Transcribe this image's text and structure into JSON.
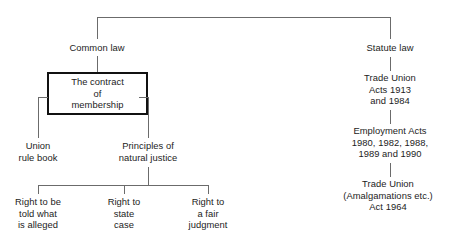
{
  "diagram": {
    "type": "tree-chart",
    "title_visible": false,
    "orientation": "top-down",
    "colors": {
      "background": "#ffffff",
      "text": "#1c1c1c",
      "connector": "#6b6b6b",
      "box_border": "#111111"
    },
    "nodes": {
      "common_law": "Common law",
      "statute_law": "Statute law",
      "contract_of_membership": "The contract\nof\nmembership",
      "union_rule_book": "Union\nrule book",
      "principles_of_natural_justice": "Principles of\nnatural justice",
      "right_told_what_alleged": "Right to be\ntold what\nis alleged",
      "right_state_case": "Right to\nstate\ncase",
      "right_fair_judgment": "Right to\na fair\njudgment",
      "trade_union_acts": "Trade Union\nActs 1913\nand 1984",
      "employment_acts": "Employment Acts\n1980, 1982, 1988,\n1989 and 1990",
      "trade_union_amalgamations": "Trade Union\n(Amalgamations etc.)\nAct 1964"
    }
  }
}
